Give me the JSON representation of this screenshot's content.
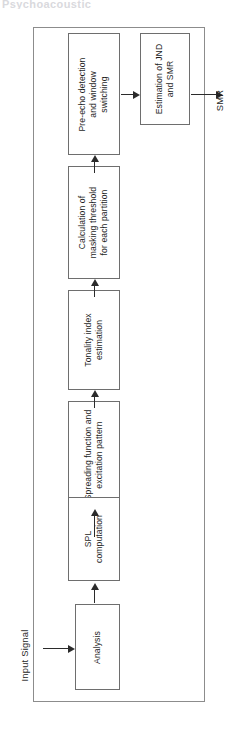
{
  "figure": {
    "type": "block-diagram",
    "orientation": "rotated-90-ccw",
    "clipped_header_text": "Psychoacoustic",
    "input_label": "Input Signal",
    "output_label": "SMR",
    "blocks": [
      {
        "id": "analysis",
        "label": "Analysis"
      },
      {
        "id": "spl",
        "label": "SPL\ncomputation",
        "line1": "SPL",
        "line2": "computation"
      },
      {
        "id": "spreading",
        "label": "Spreading function and excitation pattern",
        "line1": "Spreading function and",
        "line2": "excitation pattern"
      },
      {
        "id": "tonality",
        "label": "Tonality index estimation",
        "line1": "Tonality index",
        "line2": "estimation"
      },
      {
        "id": "masking",
        "label": "Calculation of masking threshold for each partition",
        "line1": "Calculation of",
        "line2": "masking threshold",
        "line3": "for each partition"
      },
      {
        "id": "preecho",
        "label": "Pre-echo detection and window switching",
        "line1": "Pre-echo detection",
        "line2": "and window",
        "line3": "switching"
      },
      {
        "id": "estimation",
        "label": "Estimation of JND and SMR",
        "line1": "Estimation of JND",
        "line2": "and SMR"
      }
    ],
    "colors": {
      "block_border": "#6e6e6e",
      "outer_border": "#8c8c8c",
      "arrow": "#2b2b2b",
      "text": "#1f1f1f",
      "background": "#ffffff"
    }
  }
}
